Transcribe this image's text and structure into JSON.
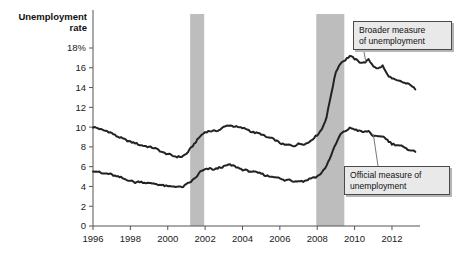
{
  "chart_data": {
    "type": "line",
    "title_line1": "Unemployment",
    "title_line2": "rate",
    "xlabel": "",
    "ylabel": "Unemployment rate",
    "ylim": [
      0,
      18
    ],
    "xlim": [
      1996,
      2013.5
    ],
    "grid": false,
    "legend_position": "annotations",
    "yticks": [
      0,
      2,
      4,
      6,
      8,
      10,
      12,
      14,
      16,
      18
    ],
    "ytick_labels": [
      "0",
      "2",
      "4",
      "6",
      "8",
      "10",
      "12",
      "14",
      "16",
      "18%"
    ],
    "xticks": [
      1996,
      1998,
      2000,
      2002,
      2004,
      2006,
      2008,
      2010,
      2012
    ],
    "xtick_labels": [
      "1996",
      "1998",
      "2000",
      "2002",
      "2004",
      "2006",
      "2008",
      "2010",
      "2012"
    ],
    "annotations": [
      {
        "name": "broader-callout",
        "text": "Broader measure\nof unemployment",
        "target_x": 2010.6,
        "target_y": 16.6
      },
      {
        "name": "official-callout",
        "text": "Official measure of\nunemployment",
        "target_x": 2011.0,
        "target_y": 9.3
      }
    ],
    "shaded_bands": [
      {
        "name": "recession-2001",
        "x0": 2001.2,
        "x1": 2001.95,
        "color": "#bdbdbd"
      },
      {
        "name": "recession-2008",
        "x0": 2007.95,
        "x1": 2009.45,
        "color": "#bdbdbd"
      }
    ],
    "series": [
      {
        "name": "Broader measure of unemployment",
        "color": "#222222",
        "x": [
          1996.0,
          1996.25,
          1996.5,
          1996.75,
          1997.0,
          1997.25,
          1997.5,
          1997.75,
          1998.0,
          1998.25,
          1998.5,
          1998.75,
          1999.0,
          1999.25,
          1999.5,
          1999.75,
          2000.0,
          2000.25,
          2000.5,
          2000.75,
          2001.0,
          2001.25,
          2001.5,
          2001.75,
          2002.0,
          2002.25,
          2002.5,
          2002.75,
          2003.0,
          2003.25,
          2003.5,
          2003.75,
          2004.0,
          2004.25,
          2004.5,
          2004.75,
          2005.0,
          2005.25,
          2005.5,
          2005.75,
          2006.0,
          2006.25,
          2006.5,
          2006.75,
          2007.0,
          2007.25,
          2007.5,
          2007.75,
          2008.0,
          2008.25,
          2008.5,
          2008.75,
          2009.0,
          2009.25,
          2009.5,
          2009.75,
          2010.0,
          2010.25,
          2010.5,
          2010.75,
          2011.0,
          2011.25,
          2011.5,
          2011.75,
          2012.0,
          2012.25,
          2012.5,
          2012.75,
          2013.0,
          2013.25
        ],
        "values": [
          10.0,
          9.9,
          9.7,
          9.6,
          9.4,
          9.1,
          8.9,
          8.7,
          8.5,
          8.4,
          8.2,
          8.1,
          8.0,
          7.9,
          7.7,
          7.4,
          7.3,
          7.1,
          7.0,
          7.0,
          7.3,
          7.9,
          8.5,
          9.1,
          9.5,
          9.6,
          9.6,
          9.7,
          10.0,
          10.2,
          10.1,
          10.0,
          9.9,
          9.8,
          9.5,
          9.4,
          9.3,
          9.0,
          8.9,
          8.7,
          8.4,
          8.2,
          8.2,
          8.1,
          8.3,
          8.3,
          8.4,
          8.8,
          9.2,
          9.8,
          11.0,
          13.4,
          15.6,
          16.5,
          16.8,
          17.2,
          16.9,
          16.6,
          16.5,
          16.8,
          16.2,
          15.9,
          16.2,
          15.3,
          14.9,
          14.7,
          14.6,
          14.4,
          14.3,
          13.8
        ]
      },
      {
        "name": "Official measure of unemployment",
        "color": "#222222",
        "x": [
          1996.0,
          1996.25,
          1996.5,
          1996.75,
          1997.0,
          1997.25,
          1997.5,
          1997.75,
          1998.0,
          1998.25,
          1998.5,
          1998.75,
          1999.0,
          1999.25,
          1999.5,
          1999.75,
          2000.0,
          2000.25,
          2000.5,
          2000.75,
          2001.0,
          2001.25,
          2001.5,
          2001.75,
          2002.0,
          2002.25,
          2002.5,
          2002.75,
          2003.0,
          2003.25,
          2003.5,
          2003.75,
          2004.0,
          2004.25,
          2004.5,
          2004.75,
          2005.0,
          2005.25,
          2005.5,
          2005.75,
          2006.0,
          2006.25,
          2006.5,
          2006.75,
          2007.0,
          2007.25,
          2007.5,
          2007.75,
          2008.0,
          2008.25,
          2008.5,
          2008.75,
          2009.0,
          2009.25,
          2009.5,
          2009.75,
          2010.0,
          2010.25,
          2010.5,
          2010.75,
          2011.0,
          2011.25,
          2011.5,
          2011.75,
          2012.0,
          2012.25,
          2012.5,
          2012.75,
          2013.0,
          2013.25
        ],
        "values": [
          5.6,
          5.5,
          5.3,
          5.3,
          5.2,
          5.0,
          4.9,
          4.7,
          4.6,
          4.4,
          4.5,
          4.4,
          4.3,
          4.3,
          4.2,
          4.1,
          4.0,
          4.0,
          4.0,
          3.9,
          4.2,
          4.5,
          4.9,
          5.5,
          5.7,
          5.8,
          5.7,
          5.9,
          6.0,
          6.2,
          6.1,
          5.9,
          5.7,
          5.6,
          5.5,
          5.4,
          5.3,
          5.1,
          5.0,
          5.0,
          4.8,
          4.6,
          4.7,
          4.5,
          4.6,
          4.5,
          4.7,
          4.9,
          5.0,
          5.4,
          6.1,
          7.2,
          8.3,
          9.3,
          9.6,
          9.9,
          9.8,
          9.6,
          9.5,
          9.6,
          9.1,
          9.0,
          9.1,
          8.7,
          8.3,
          8.2,
          8.1,
          7.8,
          7.7,
          7.5
        ]
      }
    ]
  },
  "callouts": {
    "broader": "Broader measure\nof unemployment",
    "official": "Official measure of\nunemployment"
  }
}
